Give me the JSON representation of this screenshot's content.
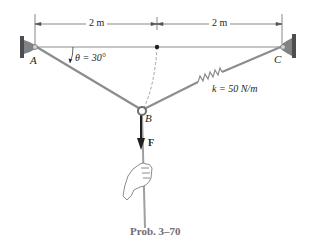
{
  "figure": {
    "caption": "Prob. 3–70",
    "dimensions": {
      "left_span": "2 m",
      "right_span": "2 m"
    },
    "points": {
      "A": "A",
      "B": "B",
      "C": "C"
    },
    "angle_label": "θ = 30°",
    "spring_label": "k = 50 N/m",
    "force_label": "F",
    "colors": {
      "cable": "#8a8c8e",
      "support": "#6d6e71",
      "text": "#231f20",
      "force_arrow": "#231f20",
      "caption": "#6d6e71"
    }
  }
}
